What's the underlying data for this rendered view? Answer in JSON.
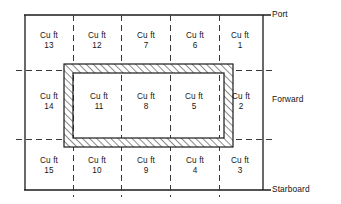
{
  "diagram": {
    "unit_label": "Cu ft",
    "rows": [
      {
        "row_name": "port-row",
        "cells": [
          {
            "unit": "Cu ft",
            "number": "13"
          },
          {
            "unit": "Cu ft",
            "number": "12"
          },
          {
            "unit": "Cu ft",
            "number": "7"
          },
          {
            "unit": "Cu ft",
            "number": "6"
          },
          {
            "unit": "Cu ft",
            "number": "1"
          }
        ]
      },
      {
        "row_name": "forward-row",
        "cells": [
          {
            "unit": "Cu ft",
            "number": "14"
          },
          {
            "unit": "Cu ft",
            "number": "11"
          },
          {
            "unit": "Cu ft",
            "number": "8"
          },
          {
            "unit": "Cu ft",
            "number": "5"
          },
          {
            "unit": "Cu ft",
            "number": "2"
          }
        ]
      },
      {
        "row_name": "starboard-row",
        "cells": [
          {
            "unit": "Cu ft",
            "number": "15"
          },
          {
            "unit": "Cu ft",
            "number": "10"
          },
          {
            "unit": "Cu ft",
            "number": "9"
          },
          {
            "unit": "Cu ft",
            "number": "4"
          },
          {
            "unit": "Cu ft",
            "number": "3"
          }
        ]
      }
    ],
    "edge_labels": {
      "port": "Port",
      "forward": "Forward",
      "starboard": "Starboard"
    },
    "colors": {
      "line": "#1a1a1a",
      "dashed_line": "#4d4d4d",
      "hatch": "#1a1a1a",
      "background": "#ffffff",
      "text": "#141414"
    }
  }
}
